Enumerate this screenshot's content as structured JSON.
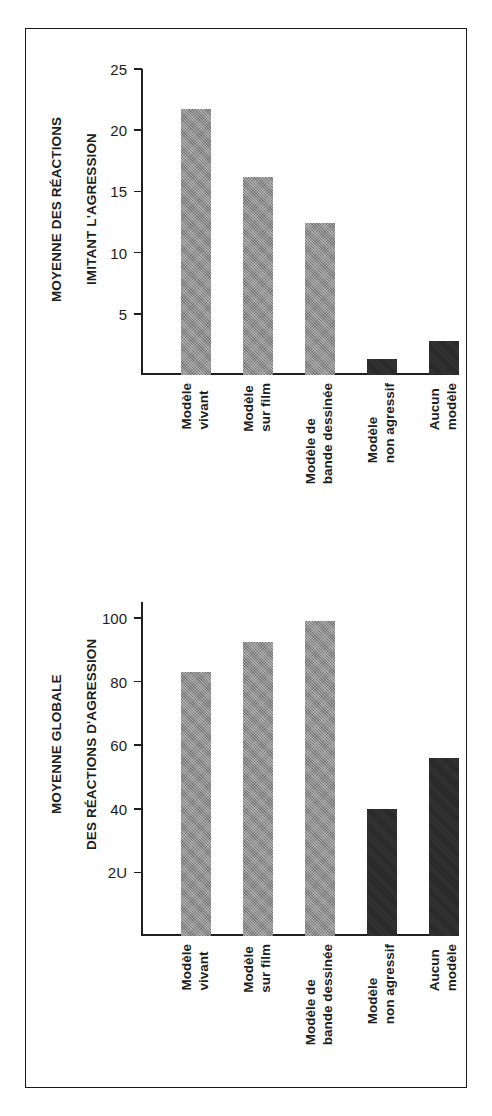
{
  "figure": {
    "background": "#ffffff",
    "border_color": "#1a1a1a",
    "gray_color": "#8d8d8d",
    "dark_color": "#262626"
  },
  "chart_data": [
    {
      "type": "bar",
      "id": "top",
      "title": "",
      "xlabel": "",
      "ylabel": "MOYENNE DES RÉACTIONS\nIMITANT L'AGRESSION",
      "ylabel_line1": "MOYENNE DES RÉACTIONS",
      "ylabel_line2": "IMITANT L'AGRESSION",
      "ylim": [
        0,
        25
      ],
      "yticks": [
        5,
        10,
        15,
        20,
        25
      ],
      "ytick_labels": [
        "5",
        "10",
        "15",
        "20",
        "25"
      ],
      "grid": false,
      "legend": "none",
      "categories": [
        "Modèle\nvivant",
        "Modèle\nsur film",
        "Modèle de\nbande dessinée",
        "Modèle\nnon agressif",
        "Aucun\nmodèle"
      ],
      "category_labels": [
        {
          "line1": "Modèle",
          "line2": "vivant"
        },
        {
          "line1": "Modèle",
          "line2": "sur film"
        },
        {
          "line1": "Modèle de",
          "line2": "bande dessinée"
        },
        {
          "line1": "Modèle",
          "line2": "non agressif"
        },
        {
          "line1": "Aucun",
          "line2": "modèle"
        }
      ],
      "values": [
        21.7,
        16.2,
        12.4,
        1.3,
        2.8
      ],
      "bar_colors": [
        "gray",
        "gray",
        "gray",
        "dark",
        "dark"
      ]
    },
    {
      "type": "bar",
      "id": "bottom",
      "title": "",
      "xlabel": "",
      "ylabel": "MOYENNE GLOBALE\nDES RÉACTIONS D'AGRESSION",
      "ylabel_line1": "MOYENNE GLOBALE",
      "ylabel_line2": "DES RÉACTIONS D'AGRESSION",
      "ylim": [
        0,
        105
      ],
      "yticks": [
        20,
        40,
        60,
        80,
        100
      ],
      "ytick_labels": [
        "2U",
        "40",
        "60",
        "80",
        "100"
      ],
      "grid": false,
      "legend": "none",
      "categories": [
        "Modèle\nvivant",
        "Modèle\nsur film",
        "Modèle de\nbande dessinée",
        "Modèle\nnon agressif",
        "Aucun\nmodèle"
      ],
      "category_labels": [
        {
          "line1": "Modèle",
          "line2": "vivant"
        },
        {
          "line1": "Modèle",
          "line2": "sur film"
        },
        {
          "line1": "Modèle de",
          "line2": "bande dessinée"
        },
        {
          "line1": "Modèle",
          "line2": "non agressif"
        },
        {
          "line1": "Aucun",
          "line2": "modèle"
        }
      ],
      "values": [
        83,
        92.5,
        99,
        40,
        56
      ],
      "bar_colors": [
        "gray",
        "gray",
        "gray",
        "dark",
        "dark"
      ]
    }
  ]
}
